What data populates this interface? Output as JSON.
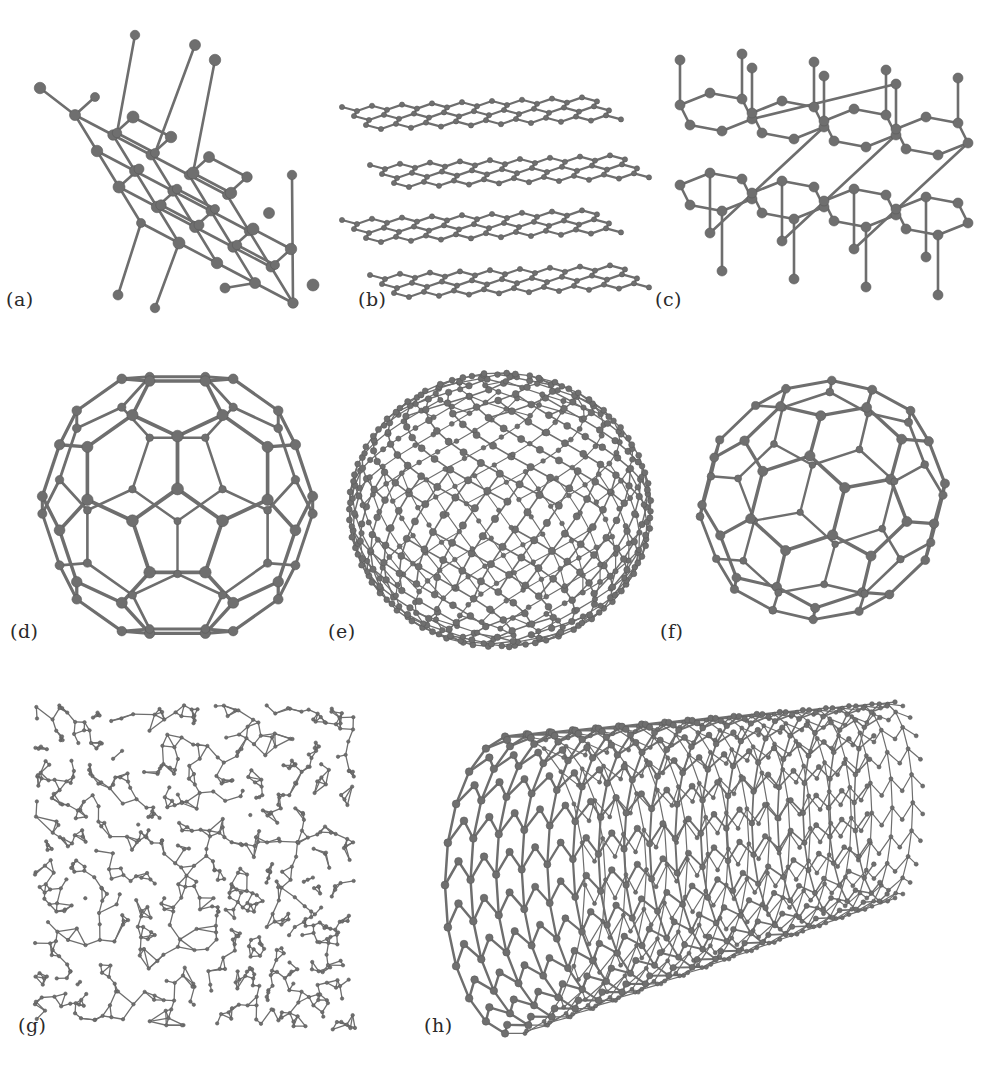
{
  "figure": {
    "colors": {
      "background": "#ffffff",
      "bond": "#6e6e6e",
      "atom": "#6f6f6f",
      "label": "#2a2a2a"
    },
    "panels": [
      {
        "id": "a",
        "label": "(a)",
        "structure": "diamond",
        "box": [
          20,
          20,
          300,
          310
        ],
        "label_pos": [
          6,
          288
        ]
      },
      {
        "id": "b",
        "label": "(b)",
        "structure": "graphite",
        "box": [
          330,
          95,
          300,
          230
        ],
        "label_pos": [
          358,
          288
        ]
      },
      {
        "id": "c",
        "label": "(c)",
        "structure": "lonsdaleite",
        "box": [
          650,
          35,
          300,
          290
        ],
        "label_pos": [
          655,
          288
        ]
      },
      {
        "id": "d",
        "label": "(d)",
        "structure": "C60-fullerene",
        "box": [
          30,
          360,
          295,
          290
        ],
        "label_pos": [
          10,
          620
        ]
      },
      {
        "id": "e",
        "label": "(e)",
        "structure": "C540-fullerene",
        "box": [
          345,
          370,
          310,
          280
        ],
        "label_pos": [
          328,
          620
        ]
      },
      {
        "id": "f",
        "label": "(f)",
        "structure": "C70-fullerene",
        "box": [
          680,
          350,
          285,
          300
        ],
        "label_pos": [
          660,
          620
        ]
      },
      {
        "id": "g",
        "label": "(g)",
        "structure": "amorphous-carbon",
        "box": [
          25,
          695,
          340,
          345
        ],
        "label_pos": [
          18,
          1014
        ]
      },
      {
        "id": "h",
        "label": "(h)",
        "structure": "carbon-nanotube",
        "box": [
          420,
          710,
          545,
          330
        ],
        "label_pos": [
          424,
          1014
        ]
      }
    ]
  }
}
